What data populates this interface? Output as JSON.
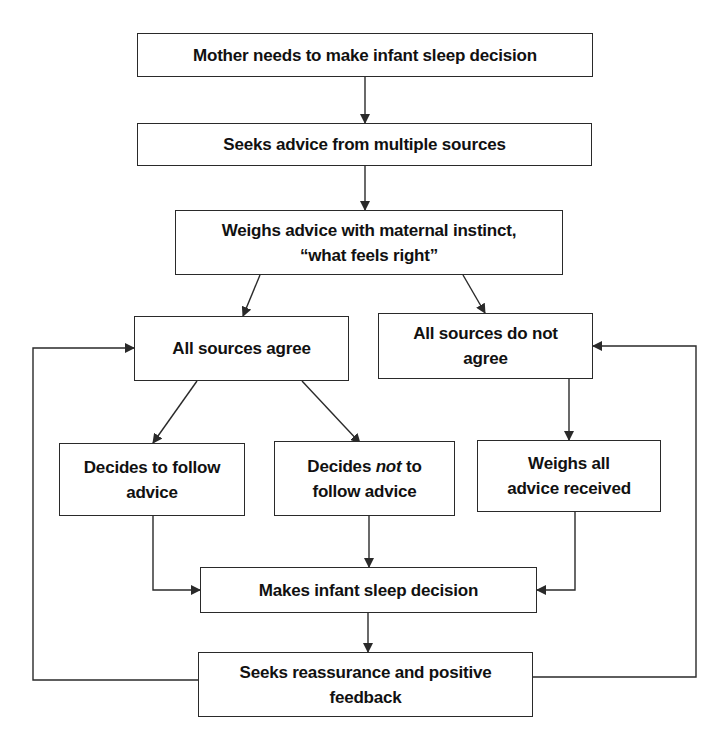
{
  "diagram": {
    "type": "flowchart",
    "nodes": [
      {
        "id": "n1",
        "text": "Mother needs to make infant sleep decision"
      },
      {
        "id": "n2",
        "text": "Seeks advice from multiple sources"
      },
      {
        "id": "n3",
        "line1": "Weighs advice with maternal instinct,",
        "line2": "“what feels right”"
      },
      {
        "id": "n4",
        "text": "All sources agree"
      },
      {
        "id": "n5",
        "line1": "All sources do not",
        "line2": "agree"
      },
      {
        "id": "n6",
        "line1": "Decides to follow",
        "line2": "advice"
      },
      {
        "id": "n7",
        "line1_pre": "Decides ",
        "line1_em": "not",
        "line1_post": " to",
        "line2": "follow advice"
      },
      {
        "id": "n8",
        "line1": "Weighs all",
        "line2": "advice received"
      },
      {
        "id": "n9",
        "text": "Makes infant sleep decision"
      },
      {
        "id": "n10",
        "line1": "Seeks reassurance and positive",
        "line2": "feedback"
      }
    ],
    "edges": [
      [
        "n1",
        "n2"
      ],
      [
        "n2",
        "n3"
      ],
      [
        "n3",
        "n4"
      ],
      [
        "n3",
        "n5"
      ],
      [
        "n4",
        "n6"
      ],
      [
        "n4",
        "n7"
      ],
      [
        "n5",
        "n8"
      ],
      [
        "n6",
        "n9"
      ],
      [
        "n7",
        "n9"
      ],
      [
        "n8",
        "n9"
      ],
      [
        "n9",
        "n10"
      ],
      [
        "n10",
        "n4"
      ],
      [
        "n10",
        "n5"
      ]
    ],
    "colors": {
      "line": "#2a2a2a",
      "background": "#ffffff",
      "text": "#111111"
    }
  }
}
